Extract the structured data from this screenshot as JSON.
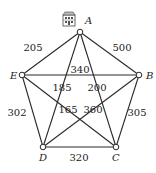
{
  "graph": {
    "nodes": [
      {
        "id": "A",
        "label": "A",
        "x": 80,
        "y": 32,
        "lx": 85,
        "ly": 24
      },
      {
        "id": "B",
        "label": "B",
        "x": 139,
        "y": 75,
        "lx": 146,
        "ly": 79
      },
      {
        "id": "C",
        "label": "C",
        "x": 116,
        "y": 147,
        "lx": 112,
        "ly": 161
      },
      {
        "id": "D",
        "label": "D",
        "x": 43,
        "y": 147,
        "lx": 39,
        "ly": 161
      },
      {
        "id": "E",
        "label": "E",
        "x": 22,
        "y": 75,
        "lx": 10,
        "ly": 79
      }
    ],
    "edges": [
      {
        "from": "A",
        "to": "E",
        "weight": "205",
        "lx": 33,
        "ly": 51
      },
      {
        "from": "A",
        "to": "B",
        "weight": "500",
        "lx": 122,
        "ly": 51
      },
      {
        "from": "E",
        "to": "B",
        "weight": "340",
        "lx": 80,
        "ly": 73
      },
      {
        "from": "A",
        "to": "D",
        "weight": "185",
        "lx": 62,
        "ly": 91
      },
      {
        "from": "A",
        "to": "C",
        "weight": "200",
        "lx": 97,
        "ly": 91
      },
      {
        "from": "E",
        "to": "C",
        "weight": "165",
        "lx": 68,
        "ly": 113
      },
      {
        "from": "B",
        "to": "D",
        "weight": "360",
        "lx": 93,
        "ly": 113
      },
      {
        "from": "E",
        "to": "D",
        "weight": "302",
        "lx": 17,
        "ly": 116
      },
      {
        "from": "B",
        "to": "C",
        "weight": "305",
        "lx": 137,
        "ly": 116
      },
      {
        "from": "D",
        "to": "C",
        "weight": "320",
        "lx": 79,
        "ly": 161
      }
    ],
    "start_icon": "building-icon"
  }
}
